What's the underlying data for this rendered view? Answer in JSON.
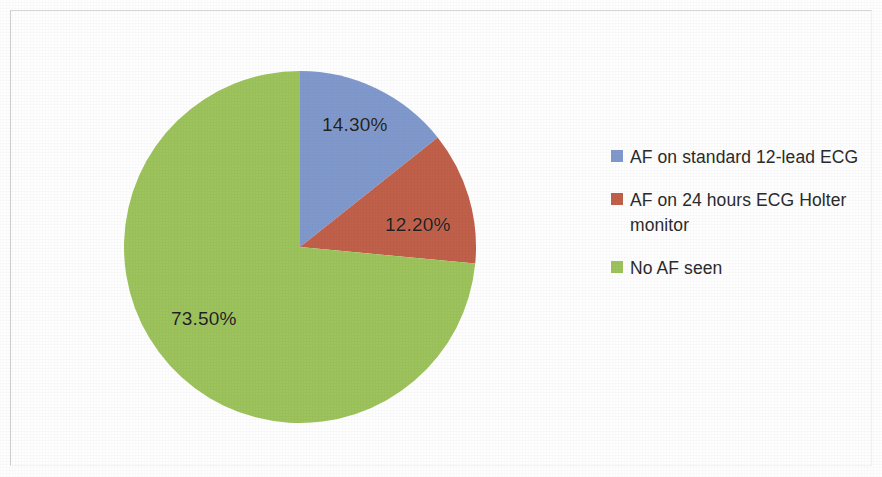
{
  "chart_data": {
    "type": "pie",
    "title": "",
    "subtitle": "",
    "xlabel": "",
    "ylabel": "",
    "grid": false,
    "legend_position": "right",
    "start_angle_deg": 0,
    "direction": "clockwise",
    "categories": [
      "AF on standard 12-lead ECG",
      "AF on 24 hours ECG Holter monitor",
      "No AF seen"
    ],
    "values": [
      14.3,
      12.2,
      73.5
    ],
    "value_unit": "%",
    "data_labels": [
      "14.30%",
      "12.20%",
      "73.50%"
    ],
    "colors": [
      "#8099cc",
      "#c0604a",
      "#9dc35c"
    ],
    "slices": [
      {
        "label": "AF on standard 12-lead ECG",
        "value": 14.3,
        "data_label": "14.30%",
        "color": "#8099cc",
        "start_angle_deg": 0,
        "end_angle_deg": 51.48
      },
      {
        "label": "AF on 24 hours ECG Holter monitor",
        "value": 12.2,
        "data_label": "12.20%",
        "color": "#c0604a",
        "start_angle_deg": 51.48,
        "end_angle_deg": 95.4
      },
      {
        "label": "No AF seen",
        "value": 73.5,
        "data_label": "73.50%",
        "color": "#9dc35c",
        "start_angle_deg": 95.4,
        "end_angle_deg": 360
      }
    ]
  },
  "legend": {
    "items": [
      {
        "label": "AF on standard 12-lead ECG",
        "color": "#8099cc"
      },
      {
        "label": "AF on 24 hours ECG Holter monitor",
        "color": "#c0604a"
      },
      {
        "label": "No AF seen",
        "color": "#9dc35c"
      }
    ]
  },
  "geometry": {
    "center_x": 177,
    "center_y": 177,
    "radius": 176
  }
}
